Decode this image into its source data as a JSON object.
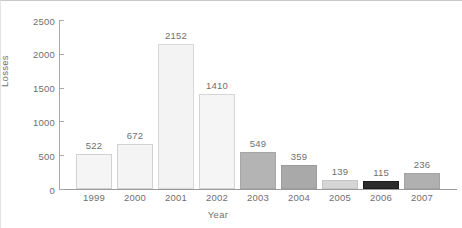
{
  "chart_data": {
    "type": "bar",
    "title": "",
    "xlabel": "Year",
    "ylabel": "Losses",
    "categories": [
      "1999",
      "2000",
      "2001",
      "2002",
      "2003",
      "2004",
      "2005",
      "2006",
      "2007"
    ],
    "values": [
      522,
      672,
      2152,
      1410,
      549,
      359,
      139,
      115,
      236
    ],
    "value_labels": [
      "522",
      "672",
      "2152",
      "1410",
      "549",
      "359",
      "139",
      "115",
      "236"
    ],
    "bar_colors": [
      "#f5f5f5",
      "#f4f4f4",
      "#f3f3f3",
      "#f5f5f5",
      "#b4b4b4",
      "#a9a9a9",
      "#d6d6d6",
      "#2b2b2b",
      "#b0b0b0"
    ],
    "bar_border_colors": [
      "#d2d2d2",
      "#d2d2d2",
      "#d8d8d8",
      "#d5d5d5",
      "#a6a6a6",
      "#9c9c9c",
      "#c4c4c4",
      "#1c1c1c",
      "#a3a3a3"
    ],
    "ylim": [
      0,
      2500
    ],
    "yticks": [
      0,
      500,
      1000,
      1500,
      2000,
      2500
    ],
    "ytick_labels": [
      "0",
      "500",
      "1000",
      "1500",
      "2000",
      "2500"
    ],
    "grid": false,
    "legend": null,
    "axis_color": "#9a9a9a",
    "text_color": "#6f6f6f"
  }
}
